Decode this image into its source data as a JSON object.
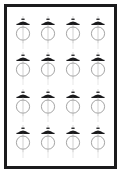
{
  "panel": {
    "name": "pendant-lamp-catalog-panel",
    "frame_color": "#1b1b1d",
    "background_color": "#ffffff",
    "border_width_px": 3
  },
  "grid": {
    "columns": 4,
    "rows": 4,
    "total_items": 16,
    "item_icon": "pendant-lamp-icon",
    "item_label": "Pendant lamp"
  },
  "icon": {
    "name": "pendant-lamp-icon",
    "stroke_color": "#8d8d8d",
    "shade_color": "#1b1b1d",
    "cord_color": "#bdbdbd",
    "globe_color": "#8d8d8d",
    "parts": [
      "ceiling-cap",
      "dome-shade",
      "cord",
      "globe",
      "tail"
    ]
  },
  "items": [
    {
      "index": 1,
      "label": "Pendant lamp"
    },
    {
      "index": 2,
      "label": "Pendant lamp"
    },
    {
      "index": 3,
      "label": "Pendant lamp"
    },
    {
      "index": 4,
      "label": "Pendant lamp"
    },
    {
      "index": 5,
      "label": "Pendant lamp"
    },
    {
      "index": 6,
      "label": "Pendant lamp"
    },
    {
      "index": 7,
      "label": "Pendant lamp"
    },
    {
      "index": 8,
      "label": "Pendant lamp"
    },
    {
      "index": 9,
      "label": "Pendant lamp"
    },
    {
      "index": 10,
      "label": "Pendant lamp"
    },
    {
      "index": 11,
      "label": "Pendant lamp"
    },
    {
      "index": 12,
      "label": "Pendant lamp"
    },
    {
      "index": 13,
      "label": "Pendant lamp"
    },
    {
      "index": 14,
      "label": "Pendant lamp"
    },
    {
      "index": 15,
      "label": "Pendant lamp"
    },
    {
      "index": 16,
      "label": "Pendant lamp"
    }
  ]
}
